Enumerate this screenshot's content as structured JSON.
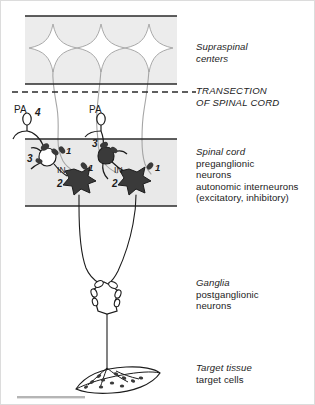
{
  "figure": {
    "colors": {
      "ink": "#1c1c1c",
      "line": "#2a2a2a",
      "gray_axon": "#9a9a9a",
      "band_fill": "#ebebeb",
      "soma_dark": "#3a3a3a",
      "frame": "#d8d8d8",
      "footer_bar": "#b5b5b5"
    },
    "right_labels": [
      {
        "name": "supraspinal-centers",
        "lines": [
          {
            "text": "Supraspinal",
            "style": "italic"
          },
          {
            "text": "centers",
            "style": "italic"
          }
        ]
      },
      {
        "name": "transection-of-spinal-cord",
        "lines": [
          {
            "text": "TRANSECTION",
            "style": "italic-caps"
          },
          {
            "text": "OF SPINAL CORD",
            "style": "italic-caps"
          }
        ]
      },
      {
        "name": "spinal-cord",
        "lines": [
          {
            "text": "Spinal cord",
            "style": "italic"
          },
          {
            "text": "preganglionic",
            "style": "regular"
          },
          {
            "text": "neurons",
            "style": "regular"
          },
          {
            "text": "autonomic interneurons",
            "style": "regular"
          },
          {
            "text": "(excitatory, inhibitory)",
            "style": "regular"
          }
        ]
      },
      {
        "name": "ganglia",
        "lines": [
          {
            "text": "Ganglia",
            "style": "italic"
          },
          {
            "text": "postganglionic",
            "style": "regular"
          },
          {
            "text": "neurons",
            "style": "regular"
          }
        ]
      },
      {
        "name": "target-tissue",
        "lines": [
          {
            "text": "Target tissue",
            "style": "italic"
          },
          {
            "text": "target cells",
            "style": "regular"
          }
        ]
      }
    ],
    "diagram_labels": {
      "pa_left": "PA",
      "pa_right": "PA",
      "marker_4": "4",
      "marker_3_left": "3",
      "marker_3_right": "3",
      "marker_1_a": "1",
      "marker_1_b": "1",
      "marker_1_c": "1",
      "marker_2_left": "2",
      "marker_2_right": "2",
      "interneuron_left": "IN",
      "interneuron_right": "IN"
    },
    "structures": {
      "supraspinal_neuron_count": 3,
      "preganglionic_neuron_count": 2,
      "interneuron_count": 2,
      "primary_afferent_count": 2,
      "ganglion_count": 1,
      "target_tissue_count": 1
    }
  }
}
